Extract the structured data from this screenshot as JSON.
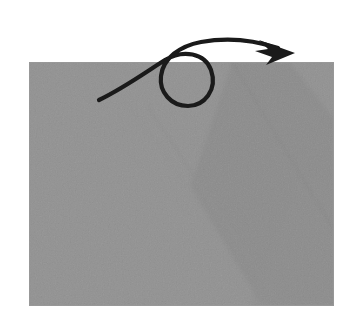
{
  "figure": {
    "type": "origami-instruction-diagram",
    "title": "Turn the paper over",
    "background_color": "#ffffff",
    "canvas": {
      "width": 359,
      "height": 325
    }
  },
  "paper": {
    "label": "Folded paper sheet",
    "shape": "rectangle",
    "base_color": "#b2b2b2",
    "shade_color": "#a6a6a6",
    "crease_color": "#a9a9a9",
    "edge_color": "#9a9a9a",
    "bounds": {
      "x": 29,
      "y": 62,
      "width": 305,
      "height": 244
    },
    "corners": {
      "top_left": [
        29,
        62
      ],
      "top_right": [
        334,
        62
      ],
      "bottom_right": [
        334,
        306
      ],
      "bottom_left": [
        29,
        306
      ]
    }
  },
  "creases": [
    {
      "name": "diagonal-crease-left",
      "description": "Faint diagonal crease running from near the top-left down toward the lower right",
      "from": [
        148,
        107
      ],
      "to": [
        281,
        306
      ]
    },
    {
      "name": "diagonal-crease-right",
      "description": "Diagonal fold edge of the upper flap, from the top edge down to the bottom-right corner",
      "from": [
        232,
        62
      ],
      "to": [
        334,
        230
      ]
    }
  ],
  "shaded_flap": {
    "name": "upper-right-flap-shade",
    "description": "Slightly darker band showing the overlapping folded flap",
    "points": "232,62 290,62 334,118 334,306 262,306 190,186"
  },
  "arrow": {
    "name": "turn-over-arrow",
    "symbol": "turn-over",
    "description": "Looped arrow indicating the model should be turned over",
    "color": "#1a1a1a",
    "stroke_width": 4.2,
    "tail_start": [
      99,
      100
    ],
    "loop_center": [
      190,
      78
    ],
    "loop_radius": 27,
    "tip": [
      295,
      53
    ],
    "path": "M 99,100 C 124,88 146,72 165,60 C 183,49 205,53 211,70 C 218,90 204,106 188,106 C 171,106 159,92 161,76 C 163,58 180,46 201,42 C 228,37 254,40 278,48",
    "head_points": "295,53 259,40 268,49 255,51 272,57 266,65"
  }
}
